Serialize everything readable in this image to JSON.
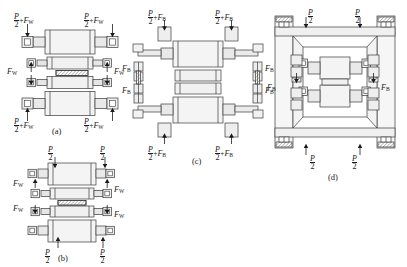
{
  "figure": {
    "type": "engineering-diagram",
    "background": "#ffffff",
    "line_color": "#3b3b3b",
    "fill_light": "#f2f2f2",
    "fill_mid": "#e3e3e3",
    "fill_dark": "#cfcfcf"
  },
  "panels": [
    {
      "id": "a",
      "caption": "(a)",
      "labels": {
        "top_left": {
          "frac_num": "P",
          "frac_den": "2",
          "op": "+",
          "force": "F",
          "force_sub": "W"
        },
        "top_right": {
          "frac_num": "P",
          "frac_den": "2",
          "op": "+",
          "force": "F",
          "force_sub": "W"
        },
        "bottom_left": {
          "frac_num": "P",
          "frac_den": "2",
          "op": "+",
          "force": "F",
          "force_sub": "W"
        },
        "bottom_right": {
          "frac_num": "P",
          "frac_den": "2",
          "op": "+",
          "force": "F",
          "force_sub": "W"
        },
        "mid_left": {
          "force": "F",
          "force_sub": "W"
        },
        "mid_right": {
          "force": "F",
          "force_sub": "W"
        }
      }
    },
    {
      "id": "b",
      "caption": "(b)",
      "labels": {
        "top_left": {
          "frac_num": "P",
          "frac_den": "2"
        },
        "top_right": {
          "frac_num": "P",
          "frac_den": "2"
        },
        "bottom_left": {
          "frac_num": "P",
          "frac_den": "2"
        },
        "bottom_right": {
          "frac_num": "P",
          "frac_den": "2"
        },
        "mid_left_upper": {
          "force": "F",
          "force_sub": "W"
        },
        "mid_right_upper": {
          "force": "F",
          "force_sub": "W"
        },
        "mid_left_lower": {
          "force": "F",
          "force_sub": "W"
        },
        "mid_right_lower": {
          "force": "F",
          "force_sub": "W"
        }
      }
    },
    {
      "id": "c",
      "caption": "(c)",
      "labels": {
        "top_left": {
          "frac_num": "P",
          "frac_den": "2",
          "op": "+",
          "force": "F",
          "force_sub": "B"
        },
        "top_right": {
          "frac_num": "P",
          "frac_den": "2",
          "op": "+",
          "force": "F",
          "force_sub": "B"
        },
        "bottom_left": {
          "frac_num": "P",
          "frac_den": "2",
          "op": "+",
          "force": "F",
          "force_sub": "B"
        },
        "bottom_right": {
          "frac_num": "P",
          "frac_den": "2",
          "op": "+",
          "force": "F",
          "force_sub": "B"
        },
        "left_upper": {
          "force": "F",
          "force_sub": "B"
        },
        "left_lower": {
          "force": "F",
          "force_sub": "B"
        },
        "right_upper": {
          "force": "F",
          "force_sub": "B"
        },
        "right_lower": {
          "force": "F",
          "force_sub": "B"
        }
      }
    },
    {
      "id": "d",
      "caption": "(d)",
      "labels": {
        "top_left": {
          "frac_num": "P",
          "frac_den": "2"
        },
        "top_right": {
          "frac_num": "P",
          "frac_den": "2"
        },
        "bottom_left": {
          "frac_num": "P",
          "frac_den": "2"
        },
        "bottom_right": {
          "frac_num": "P",
          "frac_den": "2"
        },
        "left_mid": {
          "force": "F",
          "force_sub": "B"
        },
        "right_mid": {
          "force": "F",
          "force_sub": "B"
        }
      }
    }
  ]
}
